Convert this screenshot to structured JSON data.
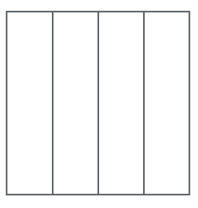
{
  "canvas": {
    "width": 198,
    "height": 208,
    "background_color": "#ffffff"
  },
  "diagram": {
    "title": "",
    "type": "line-drawing",
    "stroke_color": "#585c60",
    "stroke_width": 1.6,
    "fill_color": "#ffffff",
    "frame": {
      "x": 6.6,
      "y": 11.6,
      "width": 182.8,
      "height": 183.0
    },
    "dividers": [
      {
        "x": 52.7,
        "y1": 11.6,
        "y2": 194.6
      },
      {
        "x": 98.3,
        "y1": 11.6,
        "y2": 194.6
      },
      {
        "x": 143.9,
        "y1": 11.6,
        "y2": 194.6
      }
    ],
    "panels": [
      {
        "label": "",
        "x": 6.6,
        "y": 11.6,
        "width": 46.1,
        "height": 183.0
      },
      {
        "label": "",
        "x": 52.7,
        "y": 11.6,
        "width": 45.6,
        "height": 183.0
      },
      {
        "label": "",
        "x": 98.3,
        "y": 11.6,
        "width": 45.6,
        "height": 183.0
      },
      {
        "label": "",
        "x": 143.9,
        "y": 11.6,
        "width": 45.5,
        "height": 183.0
      }
    ],
    "panel_count": 4
  }
}
